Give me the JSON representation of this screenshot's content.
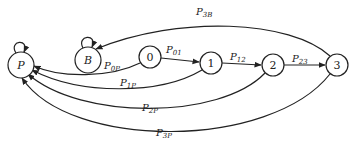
{
  "diagram": {
    "type": "state-transition",
    "nodes": [
      {
        "id": "P",
        "label": "P",
        "italic": true
      },
      {
        "id": "B",
        "label": "B",
        "italic": true
      },
      {
        "id": "0",
        "label": "0",
        "italic": false
      },
      {
        "id": "1",
        "label": "1",
        "italic": false
      },
      {
        "id": "2",
        "label": "2",
        "italic": false
      },
      {
        "id": "3",
        "label": "3",
        "italic": false
      }
    ],
    "edges": [
      {
        "from": "P",
        "to": "P",
        "main": "P",
        "sub": "",
        "self_loop": true
      },
      {
        "from": "B",
        "to": "B",
        "main": "B",
        "sub": "",
        "self_loop": true
      },
      {
        "from": "0",
        "to": "1",
        "main": "P",
        "sub": "01"
      },
      {
        "from": "1",
        "to": "2",
        "main": "P",
        "sub": "12"
      },
      {
        "from": "2",
        "to": "3",
        "main": "P",
        "sub": "23"
      },
      {
        "from": "0",
        "to": "P",
        "main": "P",
        "sub": "0P"
      },
      {
        "from": "1",
        "to": "P",
        "main": "P",
        "sub": "1P"
      },
      {
        "from": "2",
        "to": "P",
        "main": "P",
        "sub": "2P"
      },
      {
        "from": "3",
        "to": "P",
        "main": "P",
        "sub": "3P"
      },
      {
        "from": "3",
        "to": "B",
        "main": "P",
        "sub": "3B"
      }
    ]
  },
  "labels": {
    "node_P": "P",
    "node_B": "B",
    "node_0": "0",
    "node_1": "1",
    "node_2": "2",
    "node_3": "3",
    "p01_main": "P",
    "p01_sub": "01",
    "p12_main": "P",
    "p12_sub": "12",
    "p23_main": "P",
    "p23_sub": "23",
    "p0P_main": "P",
    "p0P_sub": "0P",
    "p1P_main": "P",
    "p1P_sub": "1P",
    "p2P_main": "P",
    "p2P_sub": "2P",
    "p3P_main": "P",
    "p3P_sub": "3P",
    "p3B_main": "P",
    "p3B_sub": "3B"
  }
}
